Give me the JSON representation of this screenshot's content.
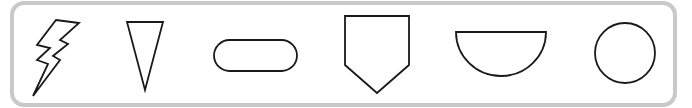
{
  "frame": {
    "border_color": "#c9c9c9",
    "background": "#ffffff"
  },
  "shapes": [
    {
      "name": "lightning-bolt",
      "label": "Lightning bolt"
    },
    {
      "name": "triangle",
      "label": "Inverted triangle"
    },
    {
      "name": "oval",
      "label": "Oval"
    },
    {
      "name": "pentagon",
      "label": "Pentagon"
    },
    {
      "name": "semicircle",
      "label": "Semicircle"
    },
    {
      "name": "circle",
      "label": "Circle"
    }
  ],
  "stroke_color": "#1a1a1a"
}
